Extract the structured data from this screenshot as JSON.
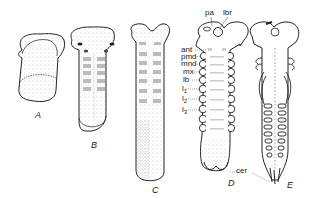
{
  "figure": {
    "stages": [
      {
        "id": "A",
        "label": "A"
      },
      {
        "id": "B",
        "label": "B"
      },
      {
        "id": "C",
        "label": "C"
      },
      {
        "id": "D",
        "label": "D"
      },
      {
        "id": "E",
        "label": "E"
      }
    ],
    "labels": {
      "pa": "pa",
      "lbr": "lbr",
      "ant": "ant",
      "pmd": "pmd",
      "mnd": "mnd",
      "mx": "mx",
      "lb": "lb",
      "l1": "l",
      "l1_sub": "1",
      "l2": "l",
      "l2_sub": "2",
      "l3": "l",
      "l3_sub": "3",
      "cer": "cer"
    },
    "colors": {
      "outline": "#222222",
      "stipple": "#9a9a9a",
      "background": "#ffffff"
    }
  }
}
